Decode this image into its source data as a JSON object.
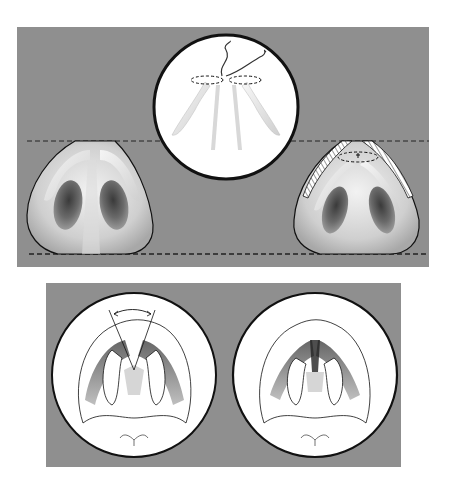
{
  "figure": {
    "background": "#ffffff",
    "panel_color": "#8f8f8f",
    "line_color": "#1a1a1a",
    "circle_fill": "#ffffff",
    "text": []
  },
  "top_panel": {
    "x": 17,
    "y": 27,
    "width": 412,
    "height": 240,
    "items": [
      {
        "name": "nose-base-before",
        "description": "Basal view of nose before tip suture"
      },
      {
        "name": "magnified-suture-inset",
        "description": "Circular inset showing interdomal suture on alar cartilages"
      },
      {
        "name": "nose-base-after",
        "description": "Basal view after suture with hatched excised area"
      }
    ],
    "guide_lines": [
      {
        "name": "tip-height-line",
        "y": 141,
        "style": "dashed"
      },
      {
        "name": "base-line",
        "y": 254,
        "style": "dashed"
      }
    ]
  },
  "bottom_panel": {
    "x": 46,
    "y": 283,
    "width": 355,
    "height": 184,
    "items": [
      {
        "name": "divergent-domes-circle",
        "description": "Domes with wide angle indicated by arc"
      },
      {
        "name": "approximated-domes-circle",
        "description": "Domes approximated after suture"
      }
    ]
  }
}
